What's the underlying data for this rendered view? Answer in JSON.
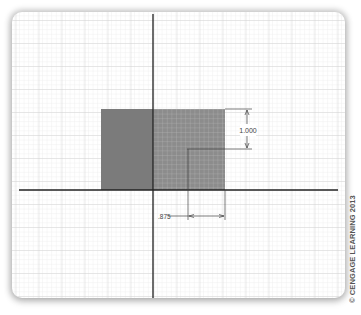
{
  "figure": {
    "type": "CAD sketch on grid paper",
    "colors": {
      "background": "#ffffff",
      "grid_minor": "#e4e4e4",
      "grid_major": "#cfcfcf",
      "axis": "#222222",
      "dark_rect": "#7a7a7a",
      "grid_rect": "#8a8a8a",
      "grid_rect_lines": "#b8b8b8",
      "dimension": "#444444"
    },
    "dimensions": {
      "vertical_label": "1.000",
      "horizontal_label": ".875"
    },
    "copyright": "© CENGAGE LEARNING 2013"
  }
}
